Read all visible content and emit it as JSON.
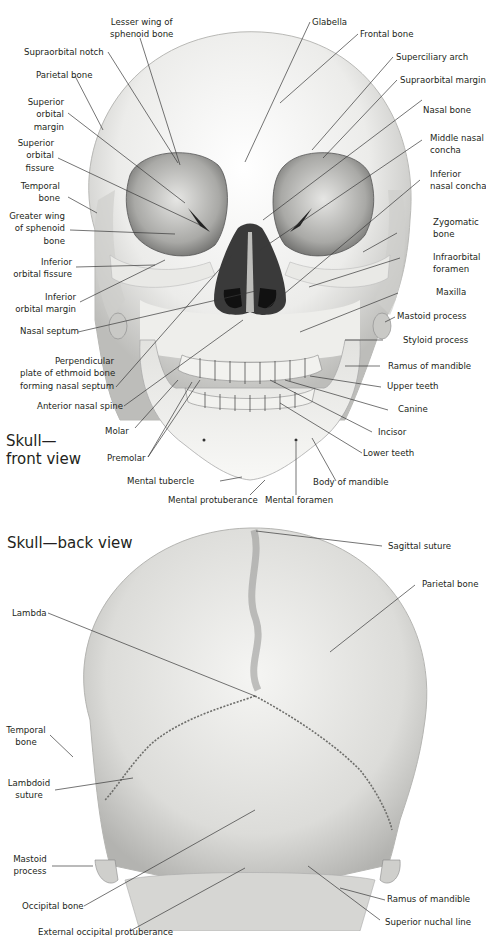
{
  "front_view": {
    "title_line1": "Skull—",
    "title_line2": "front view",
    "labels": {
      "lesser_wing_1": "Lesser wing of",
      "lesser_wing_2": "sphenoid bone",
      "glabella": "Glabella",
      "frontal_bone": "Frontal bone",
      "supraorbital_notch": "Supraorbital notch",
      "superciliary_arch": "Superciliary arch",
      "parietal_bone": "Parietal bone",
      "supraorbital_margin": "Supraorbital margin",
      "superior_orbital_margin_1": "Superior",
      "superior_orbital_margin_2": "orbital",
      "superior_orbital_margin_3": "margin",
      "nasal_bone": "Nasal bone",
      "superior_orbital_fissure_1": "Superior",
      "superior_orbital_fissure_2": "orbital",
      "superior_orbital_fissure_3": "fissure",
      "middle_nasal_concha_1": "Middle nasal",
      "middle_nasal_concha_2": "concha",
      "temporal_bone_1": "Temporal",
      "temporal_bone_2": "bone",
      "inferior_nasal_concha_1": "Inferior",
      "inferior_nasal_concha_2": "nasal concha",
      "greater_wing_1": "Greater wing",
      "greater_wing_2": "of sphenoid",
      "greater_wing_3": "bone",
      "zygomatic_bone_1": "Zygomatic",
      "zygomatic_bone_2": "bone",
      "inferior_orbital_fissure_1": "Inferior",
      "inferior_orbital_fissure_2": "orbital fissure",
      "infraorbital_foramen_1": "Infraorbital",
      "infraorbital_foramen_2": "foramen",
      "inferior_orbital_margin_1": "Inferior",
      "inferior_orbital_margin_2": "orbital margin",
      "maxilla": "Maxilla",
      "nasal_septum": "Nasal septum",
      "mastoid_process": "Mastoid process",
      "styloid_process": "Styloid process",
      "perpendicular_plate_1": "Perpendicular",
      "perpendicular_plate_2": "plate of ethmoid bone",
      "perpendicular_plate_3": "forming nasal septum",
      "ramus_of_mandible": "Ramus of mandible",
      "upper_teeth": "Upper teeth",
      "anterior_nasal_spine": "Anterior nasal spine",
      "canine": "Canine",
      "molar": "Molar",
      "incisor": "Incisor",
      "premolar": "Premolar",
      "lower_teeth": "Lower teeth",
      "mental_tubercle": "Mental tubercle",
      "body_of_mandible": "Body of mandible",
      "mental_protuberance": "Mental protuberance",
      "mental_foramen": "Mental foramen"
    }
  },
  "back_view": {
    "title": "Skull—back view",
    "labels": {
      "sagittal_suture": "Sagittal suture",
      "parietal_bone": "Parietal bone",
      "lambda": "Lambda",
      "temporal_bone_1": "Temporal",
      "temporal_bone_2": "bone",
      "lambdoid_suture_1": "Lambdoid",
      "lambdoid_suture_2": "suture",
      "mastoid_process_1": "Mastoid",
      "mastoid_process_2": "process",
      "occipital_bone": "Occipital bone",
      "ramus_of_mandible": "Ramus of mandible",
      "superior_nuchal_line": "Superior nuchal line",
      "external_occipital_protuberance": "External occipital protuberance"
    }
  },
  "colors": {
    "bone_light": "#f4f4f2",
    "bone_mid": "#d9d9d6",
    "bone_shadow": "#a8a8a5",
    "cavity": "#2a2a2a",
    "text": "#231f20"
  }
}
